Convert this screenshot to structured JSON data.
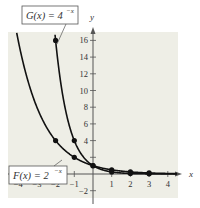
{
  "chart_data": {
    "type": "line",
    "title": "",
    "xlabel": "x",
    "ylabel": "y",
    "xlim": [
      -4.5,
      4.5
    ],
    "ylim": [
      -2.8,
      17
    ],
    "x_ticks": [
      -4,
      -3,
      -2,
      -1,
      1,
      2,
      3,
      4
    ],
    "y_ticks": [
      -2,
      2,
      4,
      6,
      8,
      10,
      12,
      14,
      16
    ],
    "y_tick_labels": [
      "-2",
      "",
      "4",
      "6",
      "8",
      "10",
      "12",
      "14",
      "16"
    ],
    "series": [
      {
        "name": "F(x) = 2^-x",
        "label_base": "F(x) = 2",
        "label_exp": "−x",
        "points": [
          [
            -2,
            4
          ],
          [
            -1,
            2
          ],
          [
            0,
            1
          ],
          [
            1,
            0.5
          ],
          [
            2,
            0.25
          ],
          [
            3,
            0.125
          ]
        ]
      },
      {
        "name": "G(x) = 4^-x",
        "label_base": "G(x) = 4",
        "label_exp": "−x",
        "points": [
          [
            -2,
            16
          ],
          [
            -1,
            4
          ],
          [
            0,
            1
          ],
          [
            1,
            0.25
          ],
          [
            2,
            0.0625
          ],
          [
            3,
            0.015625
          ]
        ]
      }
    ],
    "grid": false,
    "background": "#eeeee6",
    "line_color": "#111111"
  }
}
